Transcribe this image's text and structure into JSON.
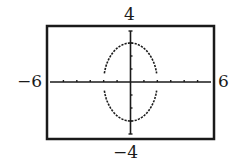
{
  "chart_data": {
    "type": "line",
    "title": "",
    "xlabel": "",
    "ylabel": "",
    "xlim": [
      -6,
      6
    ],
    "ylim": [
      -4,
      4
    ],
    "xtick_step": 1,
    "ytick_step": 1,
    "grid": false,
    "window_labels": {
      "xmin": "−6",
      "xmax": "6",
      "ymin": "−4",
      "ymax": "4"
    },
    "series": [
      {
        "name": "upper branch",
        "description": "y = 3*sqrt(1 - x^2/4), plotted dotted",
        "x": [
          -1.95,
          -1.5,
          -1,
          -0.5,
          0,
          0.5,
          1,
          1.5,
          1.95
        ],
        "y": [
          0.67,
          1.98,
          2.6,
          2.9,
          3.0,
          2.9,
          2.6,
          1.98,
          0.67
        ]
      },
      {
        "name": "lower branch",
        "description": "y = -3*sqrt(1 - x^2/4), plotted dotted",
        "x": [
          -1.95,
          -1.5,
          -1,
          -0.5,
          0,
          0.5,
          1,
          1.5,
          1.95
        ],
        "y": [
          -0.67,
          -1.98,
          -2.6,
          -2.9,
          -3.0,
          -2.9,
          -2.6,
          -1.98,
          -0.67
        ]
      }
    ]
  },
  "colors": {
    "ink": "#1a1a1a",
    "background": "#ffffff"
  }
}
